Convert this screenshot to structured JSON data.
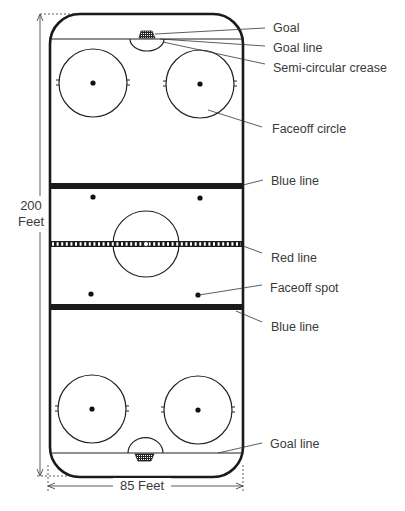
{
  "diagram": {
    "dimensions": {
      "length_value": "200",
      "length_unit": "Feet",
      "width_label": "85 Feet"
    },
    "labels": [
      {
        "id": "goal",
        "text": "Goal"
      },
      {
        "id": "goal_line_top",
        "text": "Goal line"
      },
      {
        "id": "crease",
        "text": "Semi-circular crease"
      },
      {
        "id": "faceoff_circle",
        "text": "Faceoff circle"
      },
      {
        "id": "blue_line_top",
        "text": "Blue line"
      },
      {
        "id": "red_line",
        "text": "Red line"
      },
      {
        "id": "faceoff_spot",
        "text": "Faceoff spot"
      },
      {
        "id": "blue_line_bottom",
        "text": "Blue line"
      },
      {
        "id": "goal_line_bottom",
        "text": "Goal line"
      }
    ],
    "colors": {
      "line": "#1a1a1a",
      "label_text": "#3a3a3a",
      "background": "#ffffff"
    }
  }
}
